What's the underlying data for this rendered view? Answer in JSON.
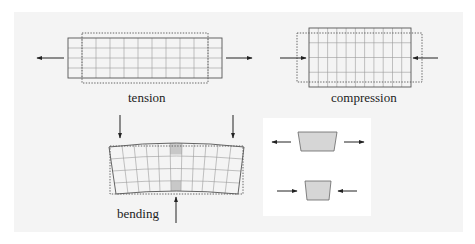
{
  "figure": {
    "background_color": "#f4f4f4",
    "panels": [
      {
        "id": "tension",
        "label": "tension",
        "grid": {
          "cols": 11,
          "rows": 4
        },
        "load_arrows": [
          "left-outward",
          "right-outward"
        ]
      },
      {
        "id": "compression",
        "label": "compression",
        "grid": {
          "cols": 11,
          "rows": 4
        },
        "load_arrows": [
          "left-inward",
          "right-inward"
        ]
      },
      {
        "id": "bending",
        "label": "bending",
        "grid": {
          "cols": 11,
          "rows": 4
        },
        "load_arrows": [
          "top-left-down",
          "top-right-down",
          "bottom-center-up"
        ],
        "highlighted_cells": [
          "top-center",
          "bottom-center"
        ]
      },
      {
        "id": "element-detail",
        "label": "",
        "elements": [
          {
            "shape": "wide trapezoid",
            "state": "stretched",
            "arrows": "outward"
          },
          {
            "shape": "narrow trapezoid",
            "state": "compressed",
            "arrows": "inward"
          }
        ]
      }
    ]
  }
}
